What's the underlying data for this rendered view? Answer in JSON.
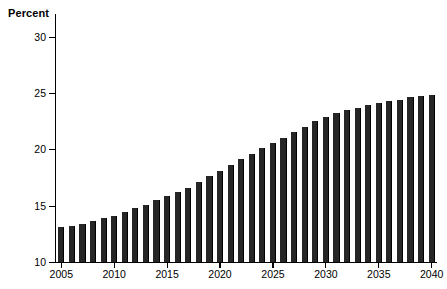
{
  "chart_data": {
    "type": "bar",
    "title": "",
    "subtitle": "",
    "xlabel": "",
    "ylabel": "Percent",
    "ylim": [
      10,
      32
    ],
    "xlim": [
      2004.5,
      2040.5
    ],
    "grid": false,
    "legend": null,
    "y_ticks": [
      10,
      15,
      20,
      25,
      30
    ],
    "y_tick_labels": [
      "10",
      "15",
      "20",
      "25",
      "30"
    ],
    "x_ticks": [
      2005,
      2010,
      2015,
      2020,
      2025,
      2030,
      2035,
      2040
    ],
    "x_tick_labels": [
      "2005",
      "2010",
      "2015",
      "2020",
      "2025",
      "2030",
      "2035",
      "2040"
    ],
    "bar_color": "#262626",
    "axis_color": "#000000",
    "background_color": "#ffffff",
    "categories": [
      "2005",
      "2006",
      "2007",
      "2008",
      "2009",
      "2010",
      "2011",
      "2012",
      "2013",
      "2014",
      "2015",
      "2016",
      "2017",
      "2018",
      "2019",
      "2020",
      "2021",
      "2022",
      "2023",
      "2024",
      "2025",
      "2026",
      "2027",
      "2028",
      "2029",
      "2030",
      "2031",
      "2032",
      "2033",
      "2034",
      "2035",
      "2036",
      "2037",
      "2038",
      "2039",
      "2040"
    ],
    "values": [
      13.1,
      13.2,
      13.4,
      13.6,
      13.9,
      14.1,
      14.4,
      14.8,
      15.1,
      15.5,
      15.9,
      16.2,
      16.6,
      17.1,
      17.6,
      18.1,
      18.6,
      19.1,
      19.6,
      20.1,
      20.6,
      21.0,
      21.5,
      22.0,
      22.5,
      22.9,
      23.2,
      23.5,
      23.7,
      23.9,
      24.1,
      24.3,
      24.4,
      24.6,
      24.7,
      24.8
    ]
  }
}
